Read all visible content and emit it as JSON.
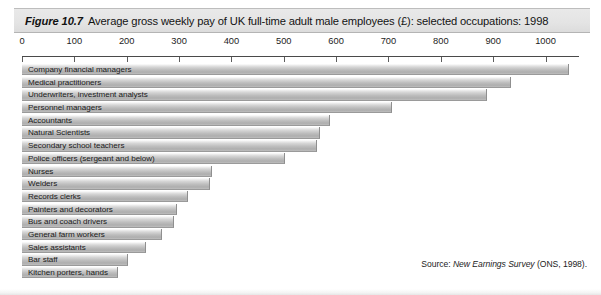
{
  "figure": {
    "number": "Figure 10.7",
    "title": "Average gross weekly pay of UK full-time adult male employees (£): selected occupations: 1998"
  },
  "source": {
    "prefix": "Source:",
    "publication": "New Earnings Survey",
    "suffix": "(ONS, 1998)."
  },
  "chart_data": {
    "type": "bar",
    "orientation": "horizontal",
    "title": "Average gross weekly pay of UK full-time adult male employees (£): selected occupations: 1998",
    "xlabel": "",
    "ylabel": "",
    "xlim": [
      0,
      1062
    ],
    "grid": false,
    "legend": null,
    "tick_labels": [
      "0",
      "100",
      "200",
      "300",
      "400",
      "500",
      "600",
      "700",
      "800",
      "900",
      "1000"
    ],
    "tick_values": [
      0,
      100,
      200,
      300,
      400,
      500,
      600,
      700,
      800,
      900,
      1000
    ],
    "categories": [
      "Company financial managers",
      "Medical practitioners",
      "Underwriters, investment analysts",
      "Personnel managers",
      "Accountants",
      "Natural Scientists",
      "Secondary school teachers",
      "Police officers (sergeant and below)",
      "Nurses",
      "Welders",
      "Records clerks",
      "Painters and decorators",
      "Bus and coach drivers",
      "General farm workers",
      "Sales assistants",
      "Bar staff",
      "Kitchen porters, hands"
    ],
    "values": [
      1045,
      935,
      888,
      706,
      588,
      569,
      563,
      502,
      362,
      359,
      317,
      296,
      290,
      267,
      237,
      202,
      183
    ],
    "unit": "£ per week"
  },
  "colors": {
    "bar_light": "#f2f2f2",
    "bar_mid": "#bdbdbd",
    "bar_dark": "#aeaeae",
    "title_band": "#e4e4e4",
    "axis": "#4a4a4a",
    "text": "#1a1a1a",
    "background": "#ffffff"
  }
}
